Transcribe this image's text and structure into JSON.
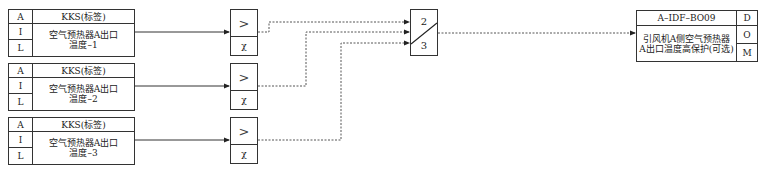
{
  "inputs": [
    {
      "col_labels": [
        "A",
        "I",
        "L"
      ],
      "tag": "KKS(标签)",
      "desc_line1": "空气预热器A出口",
      "desc_line2": "温度–1"
    },
    {
      "col_labels": [
        "A",
        "I",
        "L"
      ],
      "tag": "KKS(标签)",
      "desc_line1": "空气预热器A出口",
      "desc_line2": "温度–2"
    },
    {
      "col_labels": [
        "A",
        "I",
        "L"
      ],
      "tag": "KKS(标签)",
      "desc_line1": "空气预热器A出口",
      "desc_line2": "温度–3"
    }
  ],
  "comparators": [
    {
      "op": ">",
      "param": "χ"
    },
    {
      "op": ">",
      "param": "χ"
    },
    {
      "op": ">",
      "param": "χ"
    }
  ],
  "selector": {
    "top": "2",
    "bottom": "3"
  },
  "output": {
    "tag": "A–IDF–BO09",
    "desc_line1": "引风机A侧空气预热器",
    "desc_line2": "A出口温度高保护(可选)",
    "col_labels": [
      "D",
      "O",
      "M"
    ]
  }
}
